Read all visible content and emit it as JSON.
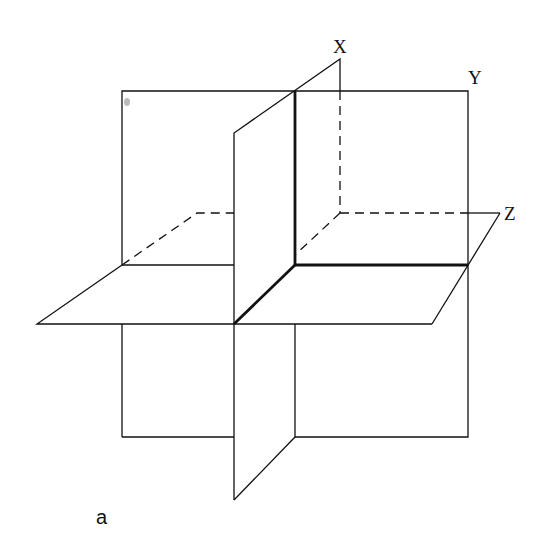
{
  "diagram": {
    "type": "three-mutually-perpendicular-planes",
    "labels": {
      "x": "X",
      "y": "Y",
      "z": "Z",
      "caption": "a"
    },
    "colors": {
      "line": "#111111",
      "background": "#ffffff"
    }
  }
}
